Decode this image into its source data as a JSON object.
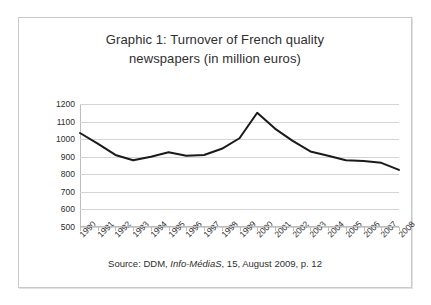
{
  "figure": {
    "title_line_1": "Graphic 1: Turnover of French quality",
    "title_line_2": "newspapers (in million euros)",
    "source_prefix": "Source: DDM, ",
    "source_journal": "Info-MédiaS",
    "source_suffix": ", 15, August 2009, p. 12"
  },
  "chart_data": {
    "type": "line",
    "title": "Graphic 1: Turnover of French quality newspapers (in million euros)",
    "xlabel": "",
    "ylabel": "",
    "categories": [
      "1990",
      "1991",
      "1992",
      "1993",
      "1994",
      "1995",
      "1996",
      "1997",
      "1998",
      "1999",
      "2000",
      "2001",
      "2002",
      "2003",
      "2004",
      "2005",
      "2006",
      "2007",
      "2008"
    ],
    "values": [
      1035,
      975,
      910,
      880,
      900,
      925,
      905,
      910,
      945,
      1005,
      1150,
      1060,
      990,
      930,
      905,
      880,
      875,
      865,
      825
    ],
    "series": [
      {
        "name": "Turnover of French quality newspapers",
        "values": [
          1035,
          975,
          910,
          880,
          900,
          925,
          905,
          910,
          945,
          1005,
          1150,
          1060,
          990,
          930,
          905,
          880,
          875,
          865,
          825
        ]
      }
    ],
    "ylim": [
      500,
      1200
    ],
    "yticks": [
      500,
      600,
      700,
      800,
      900,
      1000,
      1100,
      1200
    ],
    "ytick_labels": [
      "500",
      "600",
      "700",
      "800",
      "900",
      "1000",
      "1100",
      "1200"
    ],
    "grid": true,
    "legend": false,
    "line_color": "#1a1a1a",
    "line_width": 2,
    "units": "million euros"
  }
}
